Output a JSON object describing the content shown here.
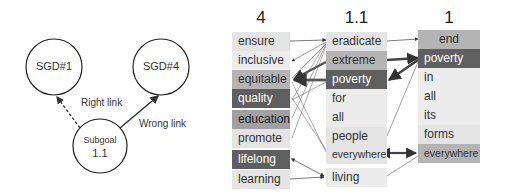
{
  "left_diagram": {
    "nodes": [
      {
        "id": "sgd1",
        "label": "SGD#1"
      },
      {
        "id": "sgd4",
        "label": "SGD#4"
      },
      {
        "id": "subgoal",
        "label_line1": "Subgoal",
        "label_line2": "1.1"
      }
    ],
    "edges": [
      {
        "from": "subgoal",
        "to": "sgd1",
        "style": "dashed",
        "label": "Right link"
      },
      {
        "from": "subgoal",
        "to": "sgd4",
        "style": "solid",
        "label": "Wrong link"
      }
    ]
  },
  "attention_diagram": {
    "columns": [
      {
        "header": "4",
        "tokens": [
          "ensure",
          "inclusive",
          "equitable",
          "quality",
          "education",
          "promote",
          "lifelong",
          "learning"
        ],
        "shades": [
          "light",
          "lighter",
          "mid",
          "dark",
          "mid2",
          "light",
          "dark",
          "light"
        ]
      },
      {
        "header": "1.1",
        "tokens": [
          "eradicate",
          "extreme",
          "poverty",
          "for",
          "all",
          "people",
          "everywhere",
          "living"
        ],
        "shades": [
          "light",
          "mid",
          "dark",
          "lighter",
          "lighter",
          "light",
          "light",
          "lighter"
        ]
      },
      {
        "header": "1",
        "tokens": [
          "end",
          "poverty",
          "in",
          "all",
          "its",
          "forms",
          "everywhere"
        ],
        "shades": [
          "mid",
          "dark",
          "lighter",
          "lighter",
          "lighter",
          "light",
          "mid"
        ]
      }
    ],
    "colors": {
      "light": "#e4e4e4",
      "lighter": "#ececec",
      "mid": "#b4b4b4",
      "mid2": "#a0a0a0",
      "dark": "#5f5f5f",
      "arrow": "#444444"
    }
  }
}
